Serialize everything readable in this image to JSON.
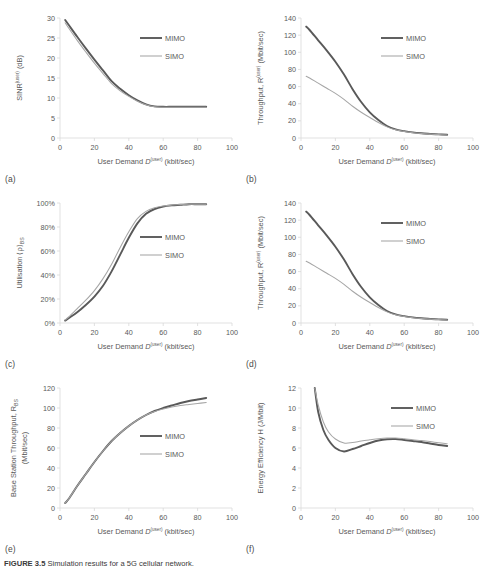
{
  "figure": {
    "caption_label": "FIGURE 3.5",
    "caption_text": "Simulation results for a 5G cellular network."
  },
  "common": {
    "xlabel_main": "User Demand ",
    "xlabel_var": "D",
    "xlabel_sup": "(user)",
    "xlabel_unit": " (kbit/sec)",
    "xticks": [
      "0",
      "20",
      "40",
      "60",
      "80",
      "100"
    ],
    "legend": [
      "MIMO",
      "SIMO"
    ],
    "color_mimo": "#595959",
    "color_simo": "#a6a6a6"
  },
  "panels": [
    {
      "letter": "(a)",
      "ylabel_pre": "SINR",
      "ylabel_sup": "(user)",
      "ylabel_post": " (dB)",
      "ylabel_sub": "",
      "yticks": [
        "0",
        "5",
        "10",
        "15",
        "20",
        "25",
        "30"
      ]
    },
    {
      "letter": "(b)",
      "ylabel_pre": "Throughput, R",
      "ylabel_sup": "(user)",
      "ylabel_post": " (Mbit/sec)",
      "ylabel_sub": "",
      "yticks": [
        "0",
        "20",
        "40",
        "60",
        "80",
        "100",
        "120",
        "140"
      ]
    },
    {
      "letter": "(c)",
      "ylabel_pre": "Utilisation ⟨ρ⟩",
      "ylabel_sup": "",
      "ylabel_post": "",
      "ylabel_sub": "BS",
      "yticks": [
        "0%",
        "20%",
        "40%",
        "60%",
        "80%",
        "100%"
      ]
    },
    {
      "letter": "(d)",
      "ylabel_pre": "Throughput, R",
      "ylabel_sup": "(user)",
      "ylabel_post": " (Mbit/sec)",
      "ylabel_sub": "",
      "yticks": [
        "0",
        "20",
        "40",
        "60",
        "80",
        "100",
        "120",
        "140"
      ]
    },
    {
      "letter": "(e)",
      "ylabel_pre": "Base Station Throughput, R",
      "ylabel_sup": "",
      "ylabel_post": "",
      "ylabel_sub": "BS",
      "ylabel_line2": "(Mbit/sec)",
      "yticks": [
        "0",
        "20",
        "40",
        "60",
        "80",
        "100",
        "120"
      ]
    },
    {
      "letter": "(f)",
      "ylabel_pre": "Energy Efficiency H (J/Mbit)",
      "ylabel_sup": "",
      "ylabel_post": "",
      "ylabel_sub": "",
      "yticks": [
        "0",
        "2",
        "4",
        "6",
        "8",
        "10",
        "12"
      ]
    }
  ],
  "chart_data": [
    {
      "panel": "a",
      "type": "line",
      "title": "",
      "xlabel": "User Demand D(user) (kbit/sec)",
      "ylabel": "SINR(user) (dB)",
      "xlim": [
        0,
        100
      ],
      "ylim": [
        0,
        30
      ],
      "xticks": [
        0,
        20,
        40,
        60,
        80,
        100
      ],
      "yticks": [
        0,
        5,
        10,
        15,
        20,
        25,
        30
      ],
      "grid": false,
      "legend_position": "center-right",
      "x": [
        3,
        5,
        10,
        15,
        20,
        25,
        30,
        35,
        40,
        45,
        50,
        55,
        60,
        65,
        70,
        75,
        80,
        85
      ],
      "series": [
        {
          "name": "MIMO",
          "values": [
            29.5,
            28.3,
            25.3,
            22.4,
            19.6,
            16.9,
            14.2,
            12.3,
            10.7,
            9.4,
            8.4,
            7.9,
            7.8,
            7.8,
            7.8,
            7.8,
            7.8,
            7.8
          ]
        },
        {
          "name": "SIMO",
          "values": [
            28.8,
            27.5,
            24.4,
            21.5,
            18.7,
            16.1,
            13.6,
            11.8,
            10.4,
            9.2,
            8.3,
            7.8,
            7.7,
            7.7,
            7.7,
            7.7,
            7.7,
            7.7
          ]
        }
      ]
    },
    {
      "panel": "b",
      "type": "line",
      "title": "",
      "xlabel": "User Demand D(user) (kbit/sec)",
      "ylabel": "Throughput, R(user) (Mbit/sec)",
      "xlim": [
        0,
        100
      ],
      "ylim": [
        0,
        140
      ],
      "xticks": [
        0,
        20,
        40,
        60,
        80,
        100
      ],
      "yticks": [
        0,
        20,
        40,
        60,
        80,
        100,
        120,
        140
      ],
      "grid": false,
      "legend_position": "center-right",
      "x": [
        3,
        5,
        10,
        15,
        20,
        25,
        30,
        35,
        40,
        45,
        50,
        55,
        60,
        65,
        70,
        75,
        80,
        85
      ],
      "series": [
        {
          "name": "MIMO",
          "values": [
            130,
            126,
            114,
            102,
            89,
            74,
            57,
            42,
            30,
            21,
            14,
            10,
            8,
            6.5,
            5.5,
            4.8,
            4.2,
            3.8
          ]
        },
        {
          "name": "SIMO",
          "values": [
            72,
            70,
            64,
            58,
            52,
            45,
            37,
            30,
            24,
            18,
            13,
            9.5,
            7.5,
            6.2,
            5.2,
            4.5,
            4.0,
            3.6
          ]
        }
      ]
    },
    {
      "panel": "c",
      "type": "line",
      "title": "",
      "xlabel": "User Demand D(user) (kbit/sec)",
      "ylabel": "Utilisation ⟨ρ⟩BS",
      "xlim": [
        0,
        100
      ],
      "ylim": [
        0,
        100
      ],
      "yunit": "%",
      "xticks": [
        0,
        20,
        40,
        60,
        80,
        100
      ],
      "yticks": [
        0,
        20,
        40,
        60,
        80,
        100
      ],
      "grid": false,
      "legend_position": "center-right",
      "x": [
        3,
        5,
        10,
        15,
        20,
        25,
        30,
        35,
        40,
        45,
        50,
        55,
        60,
        65,
        70,
        75,
        80,
        85
      ],
      "series": [
        {
          "name": "MIMO",
          "values": [
            2,
            4,
            9,
            15,
            22,
            31,
            43,
            57,
            71,
            83,
            91,
            95,
            97,
            98,
            98.5,
            99,
            99,
            99
          ]
        },
        {
          "name": "SIMO",
          "values": [
            2.5,
            5,
            12,
            19,
            27,
            37,
            49,
            63,
            76,
            87,
            93,
            96,
            97.5,
            98.3,
            98.8,
            99,
            99,
            99
          ]
        }
      ]
    },
    {
      "panel": "d",
      "type": "line",
      "title": "",
      "xlabel": "User Demand D(user) (kbit/sec)",
      "ylabel": "Throughput, R(user) (Mbit/sec)",
      "xlim": [
        0,
        100
      ],
      "ylim": [
        0,
        140
      ],
      "xticks": [
        0,
        20,
        40,
        60,
        80,
        100
      ],
      "yticks": [
        0,
        20,
        40,
        60,
        80,
        100,
        120,
        140
      ],
      "grid": false,
      "legend_position": "center-right",
      "x": [
        3,
        5,
        10,
        15,
        20,
        25,
        30,
        35,
        40,
        45,
        50,
        55,
        60,
        65,
        70,
        75,
        80,
        85
      ],
      "series": [
        {
          "name": "MIMO",
          "values": [
            130,
            126,
            114,
            102,
            89,
            74,
            57,
            42,
            30,
            21,
            14,
            10,
            8,
            6.5,
            5.5,
            4.8,
            4.2,
            3.8
          ]
        },
        {
          "name": "SIMO",
          "values": [
            72,
            70,
            64,
            58,
            52,
            45,
            37,
            30,
            24,
            18,
            13,
            9.5,
            7.5,
            6.2,
            5.2,
            4.5,
            4.0,
            3.6
          ]
        }
      ]
    },
    {
      "panel": "e",
      "type": "line",
      "title": "",
      "xlabel": "User Demand D(user) (kbit/sec)",
      "ylabel": "Base Station Throughput, RBS (Mbit/sec)",
      "xlim": [
        0,
        100
      ],
      "ylim": [
        0,
        120
      ],
      "xticks": [
        0,
        20,
        40,
        60,
        80,
        100
      ],
      "yticks": [
        0,
        20,
        40,
        60,
        80,
        100,
        120
      ],
      "grid": false,
      "legend_position": "center-right",
      "x": [
        3,
        5,
        10,
        15,
        20,
        25,
        30,
        35,
        40,
        45,
        50,
        55,
        60,
        65,
        70,
        75,
        80,
        85
      ],
      "series": [
        {
          "name": "MIMO",
          "values": [
            5,
            9,
            22,
            34,
            46,
            57,
            67,
            75,
            82,
            88,
            93,
            97,
            100,
            102.5,
            105,
            107,
            108.5,
            110
          ]
        },
        {
          "name": "SIMO",
          "values": [
            5,
            9,
            22,
            34,
            46,
            57,
            67,
            75,
            82,
            88,
            93,
            96.5,
            99,
            101,
            102.5,
            103.5,
            104.5,
            105.5
          ]
        }
      ]
    },
    {
      "panel": "f",
      "type": "line",
      "title": "",
      "xlabel": "User Demand D(user) (kbit/sec)",
      "ylabel": "Energy Efficiency H (J/Mbit)",
      "xlim": [
        0,
        100
      ],
      "ylim": [
        0,
        12
      ],
      "xticks": [
        0,
        20,
        40,
        60,
        80,
        100
      ],
      "yticks": [
        0,
        2,
        4,
        6,
        8,
        10,
        12
      ],
      "grid": false,
      "legend_position": "center-right",
      "x": [
        8,
        10,
        13,
        16,
        20,
        25,
        30,
        35,
        40,
        45,
        50,
        55,
        60,
        65,
        70,
        75,
        80,
        85
      ],
      "series": [
        {
          "name": "MIMO",
          "values": [
            12.0,
            9.6,
            7.8,
            6.8,
            6.0,
            5.65,
            5.9,
            6.2,
            6.5,
            6.75,
            6.88,
            6.9,
            6.8,
            6.7,
            6.6,
            6.45,
            6.3,
            6.2
          ]
        },
        {
          "name": "SIMO",
          "values": [
            12.0,
            10.3,
            8.6,
            7.6,
            6.9,
            6.5,
            6.55,
            6.7,
            6.82,
            6.93,
            7.0,
            7.0,
            6.92,
            6.82,
            6.74,
            6.64,
            6.52,
            6.42
          ]
        }
      ]
    }
  ]
}
